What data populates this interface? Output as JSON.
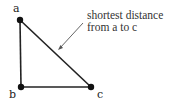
{
  "diagram": {
    "points": [
      {
        "id": "a",
        "label": "a",
        "x": 20,
        "y": 20
      },
      {
        "id": "b",
        "label": "b",
        "x": 21,
        "y": 87
      },
      {
        "id": "c",
        "label": "c",
        "x": 91,
        "y": 87
      }
    ],
    "edges": [
      {
        "from": "a",
        "to": "b"
      },
      {
        "from": "b",
        "to": "c"
      },
      {
        "from": "a",
        "to": "c"
      }
    ],
    "annotation": {
      "line1": "shortest distance",
      "line2": "from a to c",
      "points_to": "a-c edge"
    },
    "colors": {
      "line": "#222222",
      "dot": "#111111",
      "arrow": "#555555"
    }
  }
}
